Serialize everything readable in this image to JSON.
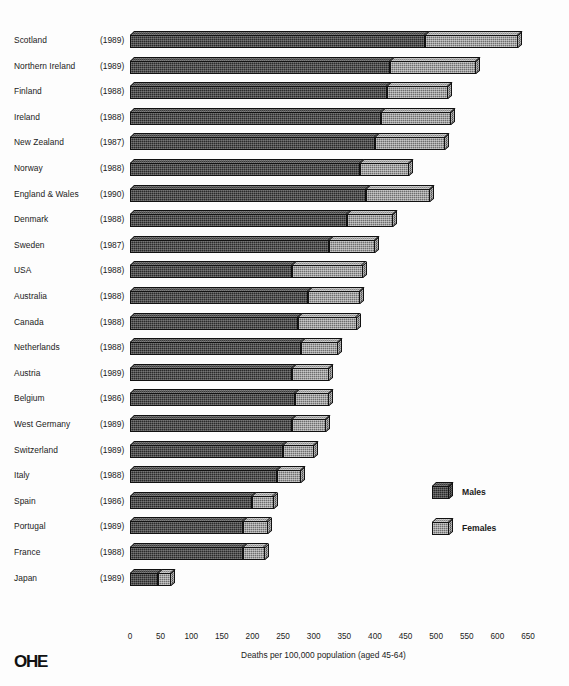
{
  "chart_data": {
    "type": "bar",
    "orientation": "horizontal",
    "stacked": true,
    "title": "",
    "xlabel": "Deaths per 100,000 population (aged 45-64)",
    "ylabel": "",
    "xlim": [
      0,
      650
    ],
    "xticks": [
      0,
      50,
      100,
      150,
      200,
      250,
      300,
      350,
      400,
      450,
      500,
      550,
      600,
      650
    ],
    "grid": false,
    "legend_position": "right-middle",
    "legend": [
      "Males",
      "Females"
    ],
    "categories": [
      "Scotland",
      "Northern Ireland",
      "Finland",
      "Ireland",
      "New Zealand",
      "Norway",
      "England & Wales",
      "Denmark",
      "Sweden",
      "USA",
      "Australia",
      "Canada",
      "Netherlands",
      "Austria",
      "Belgium",
      "West Germany",
      "Switzerland",
      "Italy",
      "Spain",
      "Portugal",
      "France",
      "Japan"
    ],
    "category_years": [
      "(1989)",
      "(1989)",
      "(1988)",
      "(1988)",
      "(1987)",
      "(1988)",
      "(1990)",
      "(1988)",
      "(1987)",
      "(1988)",
      "(1988)",
      "(1988)",
      "(1988)",
      "(1989)",
      "(1986)",
      "(1989)",
      "(1989)",
      "(1988)",
      "(1986)",
      "(1989)",
      "(1988)",
      "(1989)"
    ],
    "series": [
      {
        "name": "Males",
        "values": [
          482,
          425,
          420,
          410,
          400,
          375,
          385,
          355,
          325,
          265,
          290,
          275,
          280,
          265,
          270,
          265,
          250,
          240,
          200,
          185,
          185,
          45
        ]
      },
      {
        "name": "Females",
        "values": [
          152,
          140,
          100,
          115,
          115,
          80,
          105,
          75,
          75,
          115,
          85,
          95,
          60,
          60,
          55,
          55,
          50,
          40,
          35,
          40,
          35,
          22
        ]
      }
    ],
    "totals": [
      634,
      565,
      520,
      525,
      515,
      455,
      490,
      430,
      400,
      380,
      375,
      370,
      340,
      325,
      325,
      320,
      300,
      280,
      235,
      225,
      220,
      67
    ]
  },
  "footer": {
    "logo_text": "OHE"
  }
}
